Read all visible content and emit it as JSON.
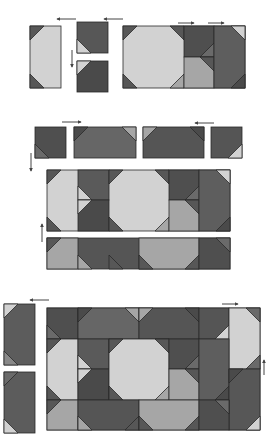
{
  "diagram": {
    "colors": {
      "light": "#d2d2d2",
      "medium": "#a6a6a6",
      "dark": "#575757",
      "darker": "#4a4a4a",
      "mid_dark": "#6a6a6a",
      "outline": "#2a2a2a",
      "arrow": "#444444",
      "background": "#ffffff"
    },
    "steps": [
      {
        "name": "step-1",
        "description": "Join corner units and sew to octagon block row",
        "arrows": [
          "left",
          "left",
          "down",
          "right",
          "right"
        ]
      },
      {
        "name": "step-2",
        "description": "Join border strips and add to center band",
        "arrows": [
          "right",
          "left",
          "down",
          "up"
        ]
      },
      {
        "name": "step-3",
        "description": "Add side border units to complete quilt",
        "arrows": [
          "left",
          "right",
          "up"
        ]
      }
    ]
  }
}
